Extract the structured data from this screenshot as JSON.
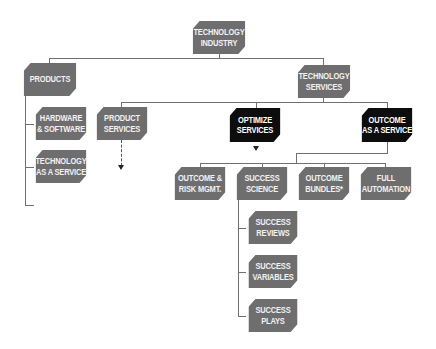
{
  "diagram": {
    "type": "hierarchy",
    "nodes": {
      "technology_industry": "TECHNOLOGY\nINDUSTRY",
      "products": "PRODUCTS",
      "technology_services": "TECHNOLOGY\nSERVICES",
      "hardware_software": "HARDWARE\n& SOFTWARE",
      "technology_as_a_service": "TECHNOLOGY\nAS A SERVICE",
      "product_services": "PRODUCT\nSERVICES",
      "optimize_services": "OPTIMIZE\nSERVICES",
      "outcome_as_a_service": "OUTCOME\nAS A SERVICE",
      "outcome_risk_mgmt": "OUTCOME &\nRISK MGMT.",
      "success_science": "SUCCESS\nSCIENCE",
      "outcome_bundles": "OUTCOME\nBUNDLES*",
      "full_automation": "FULL\nAUTOMATION",
      "success_reviews": "SUCCESS\nREVIEWS",
      "success_variables": "SUCCESS\nVARIABLES",
      "success_plays": "SUCCESS\nPLAYS"
    },
    "colors": {
      "gray_node": "#6e6e6e",
      "highlight_node": "#0d0d0d",
      "connector": "#707070"
    },
    "edges": [
      [
        "technology_industry",
        "products"
      ],
      [
        "technology_industry",
        "technology_services"
      ],
      [
        "products",
        "hardware_software"
      ],
      [
        "products",
        "technology_as_a_service"
      ],
      [
        "technology_services",
        "product_services"
      ],
      [
        "technology_services",
        "optimize_services"
      ],
      [
        "technology_services",
        "outcome_as_a_service"
      ],
      [
        "outcome_as_a_service",
        "outcome_risk_mgmt"
      ],
      [
        "outcome_as_a_service",
        "success_science"
      ],
      [
        "outcome_as_a_service",
        "outcome_bundles"
      ],
      [
        "outcome_as_a_service",
        "full_automation"
      ],
      [
        "success_science",
        "success_reviews"
      ],
      [
        "success_science",
        "success_variables"
      ],
      [
        "success_science",
        "success_plays"
      ]
    ]
  }
}
